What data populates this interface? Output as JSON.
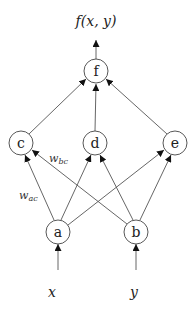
{
  "diagram": {
    "type": "neural-network",
    "output_label": "f(x, y)",
    "nodes": [
      {
        "id": "f",
        "label": "f",
        "cx": 96,
        "cy": 71
      },
      {
        "id": "c",
        "label": "c",
        "cx": 21,
        "cy": 143
      },
      {
        "id": "d",
        "label": "d",
        "cx": 95,
        "cy": 143
      },
      {
        "id": "e",
        "label": "e",
        "cx": 175,
        "cy": 143
      },
      {
        "id": "a",
        "label": "a",
        "cx": 58,
        "cy": 232
      },
      {
        "id": "b",
        "label": "b",
        "cx": 136,
        "cy": 232
      }
    ],
    "inputs": [
      {
        "label": "x",
        "to": "a"
      },
      {
        "label": "y",
        "to": "b"
      }
    ],
    "edges": [
      {
        "from": "a",
        "to": "c"
      },
      {
        "from": "a",
        "to": "d"
      },
      {
        "from": "a",
        "to": "e"
      },
      {
        "from": "b",
        "to": "c"
      },
      {
        "from": "b",
        "to": "d"
      },
      {
        "from": "b",
        "to": "e"
      },
      {
        "from": "c",
        "to": "f"
      },
      {
        "from": "d",
        "to": "f"
      },
      {
        "from": "e",
        "to": "f"
      }
    ],
    "weight_labels": [
      {
        "base": "w",
        "sub": "bc"
      },
      {
        "base": "w",
        "sub": "ac"
      }
    ]
  }
}
